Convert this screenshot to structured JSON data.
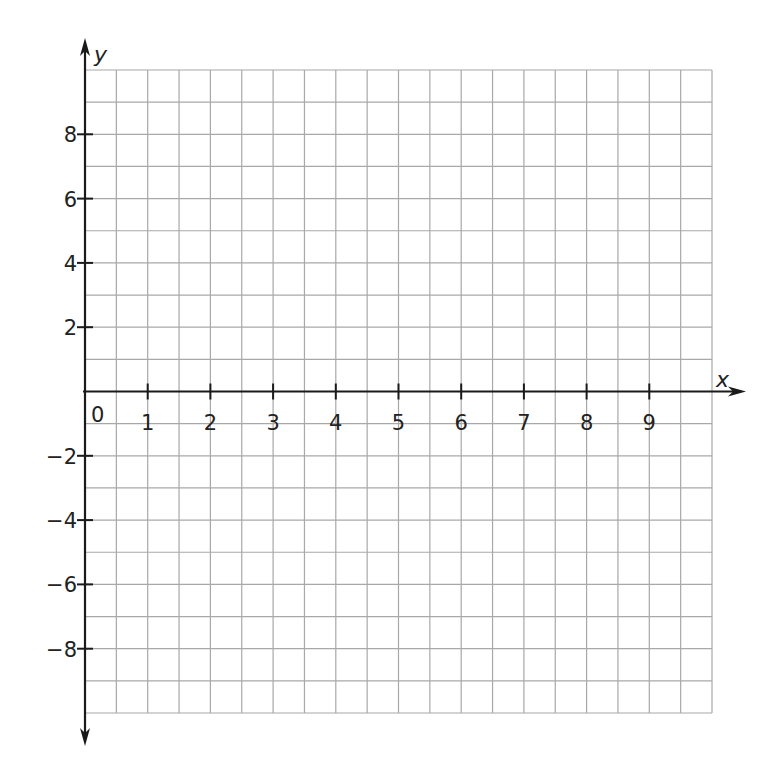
{
  "chart_data": {
    "type": "scatter",
    "title": "",
    "xlabel": "x",
    "ylabel": "y",
    "xlim": [
      0,
      10
    ],
    "ylim": [
      -10,
      10
    ],
    "grid": true,
    "x_grid_step": 0.5,
    "y_grid_step": 1,
    "x_ticks": [
      1,
      2,
      3,
      4,
      5,
      6,
      7,
      8,
      9
    ],
    "y_ticks": [
      -8,
      -6,
      -4,
      -2,
      2,
      4,
      6,
      8
    ],
    "origin_label": "0",
    "series": []
  },
  "colors": {
    "grid": "#a8a8a8",
    "axis": "#1a1a1a"
  }
}
